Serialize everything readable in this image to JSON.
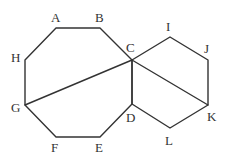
{
  "diagram": {
    "type": "geometry",
    "stroke_color": "#333333",
    "background": "#ffffff",
    "vertices": {
      "A": {
        "x": 56,
        "y": 28,
        "label": "A",
        "lx": 51,
        "ly": 22
      },
      "B": {
        "x": 100,
        "y": 28,
        "label": "B",
        "lx": 95,
        "ly": 22
      },
      "C": {
        "x": 132,
        "y": 60,
        "label": "C",
        "lx": 126,
        "ly": 52
      },
      "D": {
        "x": 132,
        "y": 104,
        "label": "D",
        "lx": 126,
        "ly": 122
      },
      "E": {
        "x": 100,
        "y": 137,
        "label": "E",
        "lx": 95,
        "ly": 152
      },
      "F": {
        "x": 56,
        "y": 137,
        "label": "F",
        "lx": 51,
        "ly": 152
      },
      "G": {
        "x": 25,
        "y": 105,
        "label": "G",
        "lx": 11,
        "ly": 112
      },
      "H": {
        "x": 25,
        "y": 60,
        "label": "H",
        "lx": 11,
        "ly": 62
      },
      "I": {
        "x": 170,
        "y": 37,
        "label": "I",
        "lx": 166,
        "ly": 31
      },
      "J": {
        "x": 208,
        "y": 60,
        "label": "J",
        "lx": 204,
        "ly": 53
      },
      "K": {
        "x": 208,
        "y": 105,
        "label": "K",
        "lx": 207,
        "ly": 121
      },
      "L": {
        "x": 170,
        "y": 128,
        "label": "L",
        "lx": 165,
        "ly": 145
      }
    },
    "octagon": [
      "A",
      "B",
      "C",
      "D",
      "E",
      "F",
      "G",
      "H"
    ],
    "hexagon": [
      "C",
      "I",
      "J",
      "K",
      "L",
      "D"
    ],
    "segments": [
      [
        "C",
        "G"
      ],
      [
        "C",
        "K"
      ]
    ]
  }
}
